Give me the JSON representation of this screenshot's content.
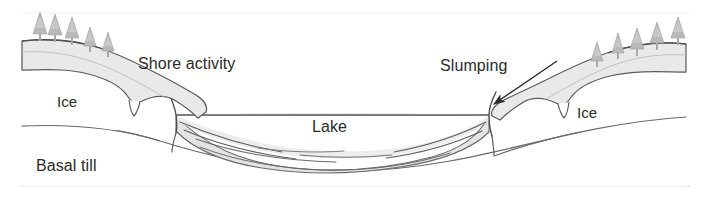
{
  "figure": {
    "type": "cross-section-diagram",
    "width": 707,
    "height": 208,
    "background_color": "#ffffff"
  },
  "labels": {
    "shore_activity": "Shore activity",
    "slumping": "Slumping",
    "ice_left": "Ice",
    "ice_right": "Ice",
    "lake": "Lake",
    "basal_till": "Basal till"
  },
  "colors": {
    "outline": "#5a5a5a",
    "outline_dark": "#3f3f3f",
    "debris_fill": "#e6e6e6",
    "sediment_fill": "#e4e4e4",
    "sediment_line": "#6b6b6b",
    "tree_fill": "#b9b9b9",
    "tree_outline": "#9a9a9a",
    "ice_fill": "#ffffff",
    "text": "#2b2b2b",
    "frame": "#d8d8d8"
  },
  "annotations": [
    {
      "name": "slumping-arrow",
      "kind": "arrow",
      "from": [
        557,
        61
      ],
      "to": [
        492,
        105
      ],
      "direction": "down-left",
      "points_at": "ice margin / slump scar on right ice block"
    }
  ],
  "features": {
    "trees_left": {
      "count": 5,
      "description": "conifers on left ice surface, decreasing in height rightward"
    },
    "trees_right": {
      "count": 5,
      "description": "conifers on right ice surface, increasing in height rightward"
    },
    "lake_surface_y": 115,
    "ice_blocks": 2,
    "sediment_layers": 6,
    "basal_till_label_position": "lower left, beneath ice and lake basin"
  }
}
